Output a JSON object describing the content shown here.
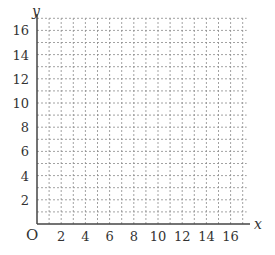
{
  "chart_data": {
    "type": "scatter",
    "title": "",
    "xlabel": "x",
    "ylabel": "y",
    "origin_label": "O",
    "xlim": [
      0,
      17
    ],
    "ylim": [
      0,
      17
    ],
    "x_ticks": [
      2,
      4,
      6,
      8,
      10,
      12,
      14,
      16
    ],
    "y_ticks": [
      2,
      4,
      6,
      8,
      10,
      12,
      14,
      16
    ],
    "grid": {
      "on": true,
      "step": 1,
      "style": "dashed"
    },
    "series": []
  },
  "colors": {
    "axis": "#444444",
    "grid": "#8a8a8a",
    "text": "#333333"
  }
}
